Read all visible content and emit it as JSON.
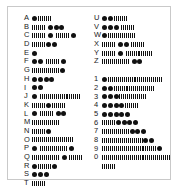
{
  "chart_data": {
    "type": "table",
    "notation": {
      "dot": "·",
      "dash": "—"
    },
    "columns": [
      {
        "name": "letters-a-t",
        "rows": [
          {
            "label": "A",
            "code": "·—",
            "symbols": [
              "dot",
              "dash"
            ]
          },
          {
            "label": "B",
            "code": "—···",
            "symbols": [
              "dash",
              "dot",
              "dot",
              "dot"
            ]
          },
          {
            "label": "C",
            "code": "—·—·",
            "symbols": [
              "dash",
              "dot",
              "dash",
              "dot"
            ]
          },
          {
            "label": "D",
            "code": "—··",
            "symbols": [
              "dash",
              "dot",
              "dot"
            ]
          },
          {
            "label": "E",
            "code": "·",
            "symbols": [
              "dot"
            ]
          },
          {
            "label": "F",
            "code": "··—·",
            "symbols": [
              "dot",
              "dot",
              "dash",
              "dot"
            ]
          },
          {
            "label": "G",
            "code": "——·",
            "symbols": [
              "dash",
              "dash",
              "dot"
            ]
          },
          {
            "label": "H",
            "code": "····",
            "symbols": [
              "dot",
              "dot",
              "dot",
              "dot"
            ]
          },
          {
            "label": "I",
            "code": "··",
            "symbols": [
              "dot",
              "dot"
            ]
          },
          {
            "label": "J",
            "code": "·———",
            "symbols": [
              "dot",
              "dash",
              "dash",
              "dash"
            ]
          },
          {
            "label": "K",
            "code": "—·—",
            "symbols": [
              "dash",
              "dot",
              "dash"
            ]
          },
          {
            "label": "L",
            "code": "·—··",
            "symbols": [
              "dot",
              "dash",
              "dot",
              "dot"
            ]
          },
          {
            "label": "M",
            "code": "——",
            "symbols": [
              "dash",
              "dash"
            ]
          },
          {
            "label": "N",
            "code": "—·",
            "symbols": [
              "dash",
              "dot"
            ]
          },
          {
            "label": "O",
            "code": "———",
            "symbols": [
              "dash",
              "dash",
              "dash"
            ]
          },
          {
            "label": "P",
            "code": "·——·",
            "symbols": [
              "dot",
              "dash",
              "dash",
              "dot"
            ]
          },
          {
            "label": "Q",
            "code": "——·—",
            "symbols": [
              "dash",
              "dash",
              "dot",
              "dash"
            ]
          },
          {
            "label": "R",
            "code": "·—·",
            "symbols": [
              "dot",
              "dash",
              "dot"
            ]
          },
          {
            "label": "S",
            "code": "···",
            "symbols": [
              "dot",
              "dot",
              "dot"
            ]
          },
          {
            "label": "T",
            "code": "—",
            "symbols": [
              "dash"
            ]
          }
        ]
      },
      {
        "name": "letters-u-z-and-digits",
        "rows": [
          {
            "label": "U",
            "code": "··—",
            "symbols": [
              "dot",
              "dot",
              "dash"
            ]
          },
          {
            "label": "V",
            "code": "···—",
            "symbols": [
              "dot",
              "dot",
              "dot",
              "dash"
            ]
          },
          {
            "label": "W",
            "code": "·——",
            "symbols": [
              "dot",
              "dash",
              "dash"
            ]
          },
          {
            "label": "X",
            "code": "—··—",
            "symbols": [
              "dash",
              "dot",
              "dot",
              "dash"
            ]
          },
          {
            "label": "Y",
            "code": "—·——",
            "symbols": [
              "dash",
              "dot",
              "dash",
              "dash"
            ]
          },
          {
            "label": "Z",
            "code": "——··",
            "symbols": [
              "dash",
              "dash",
              "dot",
              "dot"
            ]
          },
          {
            "label": "1",
            "code": "·————",
            "symbols": [
              "dot",
              "dash",
              "dash",
              "dash",
              "dash"
            ]
          },
          {
            "label": "2",
            "code": "··———",
            "symbols": [
              "dot",
              "dot",
              "dash",
              "dash",
              "dash"
            ]
          },
          {
            "label": "3",
            "code": "···——",
            "symbols": [
              "dot",
              "dot",
              "dot",
              "dash",
              "dash"
            ]
          },
          {
            "label": "4",
            "code": "····—",
            "symbols": [
              "dot",
              "dot",
              "dot",
              "dot",
              "dash"
            ]
          },
          {
            "label": "5",
            "code": "·····",
            "symbols": [
              "dot",
              "dot",
              "dot",
              "dot",
              "dot"
            ]
          },
          {
            "label": "6",
            "code": "—····",
            "symbols": [
              "dash",
              "dot",
              "dot",
              "dot",
              "dot"
            ]
          },
          {
            "label": "7",
            "code": "——···",
            "symbols": [
              "dash",
              "dash",
              "dot",
              "dot",
              "dot"
            ]
          },
          {
            "label": "8",
            "code": "———··",
            "symbols": [
              "dash",
              "dash",
              "dash",
              "dot",
              "dot"
            ]
          },
          {
            "label": "9",
            "code": "————·",
            "symbols": [
              "dash",
              "dash",
              "dash",
              "dash",
              "dot"
            ]
          },
          {
            "label": "0",
            "code": "—————",
            "symbols": [
              "dash",
              "dash",
              "dash",
              "dash",
              "dash"
            ]
          }
        ]
      }
    ],
    "spacer_after_row_index_right": 5
  },
  "style": {
    "ink": "#111111",
    "page": "#ffffff",
    "border": "#c9c9c9"
  }
}
